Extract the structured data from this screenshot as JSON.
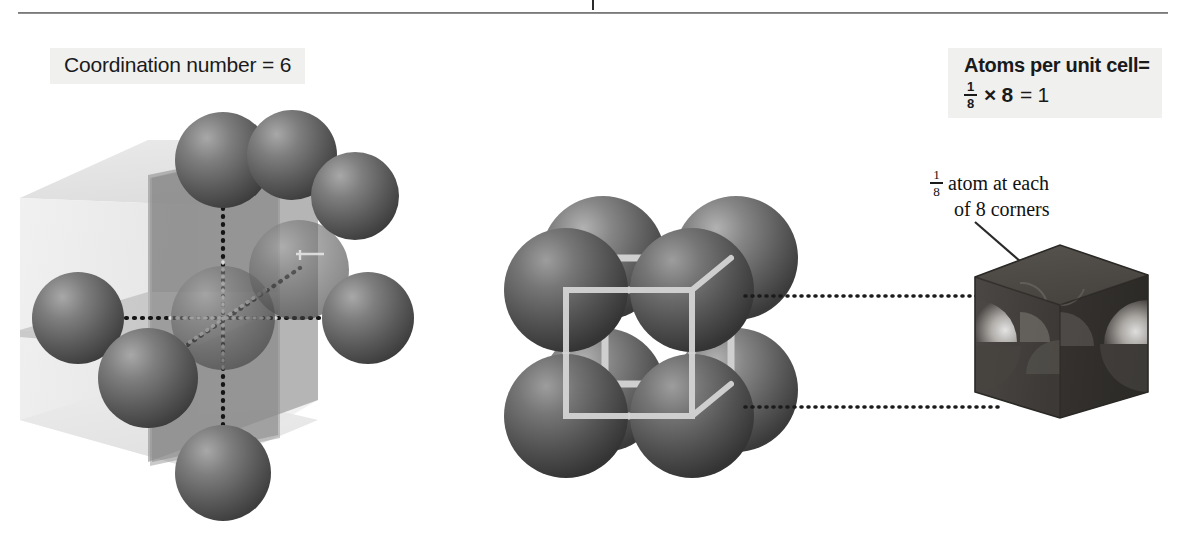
{
  "figure": {
    "title_rule": "horizontal-rule",
    "background": "#ffffff"
  },
  "labels": {
    "coordination": {
      "text": "Coordination number = 6",
      "box_color": "#f0f0ef"
    },
    "atoms_per_cell": {
      "line1": "Atoms per unit cell=",
      "fraction_numerator": "1",
      "fraction_denominator": "8",
      "times": "× 8",
      "result": "= 1",
      "box_color": "#f0f0ef"
    },
    "corner_note": {
      "fraction_numerator": "1",
      "fraction_denominator": "8",
      "line1": "atom at each",
      "line2": "of 8 corners"
    }
  },
  "colors": {
    "sphere_dark": "#4a4a4a",
    "sphere_light": "#9b9b9b",
    "cube_face_light": "#e3e3e3",
    "cube_face_mid": "#c9c9c9",
    "plane_dark": "#8e8e8e",
    "wireframe": "#d0d0d0",
    "solid_cube": "#3d3a37",
    "dotted_line": "#1b1b1b",
    "rule": "#7a7a7a"
  },
  "diagrams": {
    "left": {
      "name": "coordination-number-diagram",
      "description": "Translucent cube with intersecting planes, central atom bonded by dotted lines to 6 neighbours",
      "neighbour_count": 6
    },
    "middle": {
      "name": "simple-cubic-unit-cell",
      "description": "Eight corner spheres of a simple cubic cell with light wireframe cube outline",
      "corner_atoms": 8
    },
    "right": {
      "name": "unit-cell-fraction-cube",
      "description": "Solid dark cube showing eighth-sphere sections carved at each corner",
      "fraction_per_corner": "1/8"
    }
  }
}
